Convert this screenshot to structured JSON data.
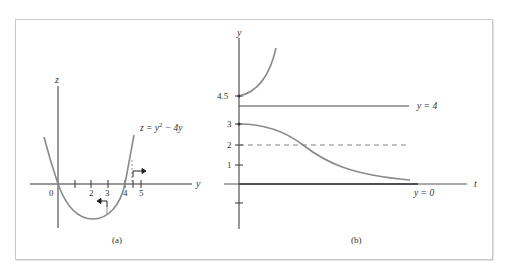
{
  "figure": {
    "panels": [
      {
        "id": "a",
        "caption": "(a)",
        "vertical_axis_label": "z",
        "horizontal_axis_label": "y",
        "tick_labels": [
          "0",
          "2",
          "3",
          "4",
          "5"
        ],
        "curve_label": "z = y² − 4y",
        "curve_label_parts": {
          "lhs": "z = y",
          "exp": "2",
          "rhs": " − 4y"
        },
        "arrows": [
          {
            "at": "3",
            "direction": "left"
          },
          {
            "at": "4.5",
            "direction": "right"
          }
        ]
      },
      {
        "id": "b",
        "caption": "(b)",
        "vertical_axis_label": "y",
        "horizontal_axis_label": "t",
        "tick_labels": [
          "4.5",
          "3",
          "2",
          "1"
        ],
        "equilibria": [
          {
            "label": "y = 4",
            "value": 4,
            "style": "solid"
          },
          {
            "label": "y = 0",
            "value": 0,
            "style": "solid"
          }
        ],
        "dashed_line": {
          "value": 2
        },
        "solution_curves": [
          {
            "initial": 4.5,
            "behavior": "increases without bound"
          },
          {
            "initial": 3,
            "behavior": "decreases toward y = 0, inflection at y = 2"
          }
        ]
      }
    ],
    "colors": {
      "axis": "#333333",
      "curve": "#8a8a8a",
      "frame": "#c8c8c8",
      "text": "#333333"
    }
  }
}
